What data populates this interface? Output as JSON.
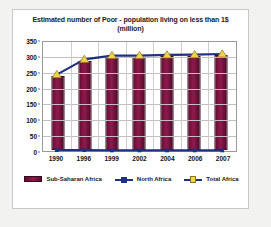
{
  "chart_data": {
    "type": "bar",
    "title": "Estimated number of Poor - population living on less than 1$ (million)",
    "title_line1": "Estimated number of Poor - population living on less than 1$",
    "title_line2": "(million)",
    "xlabel": "",
    "ylabel": "",
    "ylim": [
      0,
      350
    ],
    "ytick_step": 50,
    "yticks": [
      "0",
      "50",
      "100",
      "150",
      "200",
      "250",
      "300",
      "350"
    ],
    "categories": [
      "1990",
      "1996",
      "1999",
      "2002",
      "2004",
      "2006",
      "2007"
    ],
    "grid": true,
    "legend_position": "bottom",
    "series": [
      {
        "name": "Sub-Saharan Africa",
        "kind": "bar",
        "color": "#7d1342",
        "values": [
          240,
          288,
          300,
          299,
          302,
          303,
          305
        ]
      },
      {
        "name": "North Africa",
        "kind": "line",
        "color": "#1f3080",
        "marker": "square",
        "values": [
          6,
          6,
          5,
          5,
          5,
          5,
          5
        ]
      },
      {
        "name": "Total Africa",
        "kind": "line",
        "color": "#1f3080",
        "marker": "triangle",
        "marker_color": "#f2d14b",
        "values": [
          244,
          292,
          304,
          304,
          306,
          307,
          309
        ]
      }
    ]
  },
  "legend": {
    "items": [
      {
        "label": "Sub-Saharan Africa",
        "type": "bar"
      },
      {
        "label": "North Africa",
        "type": "line-square"
      },
      {
        "label": "Total Africa",
        "type": "line-triangle"
      }
    ]
  }
}
